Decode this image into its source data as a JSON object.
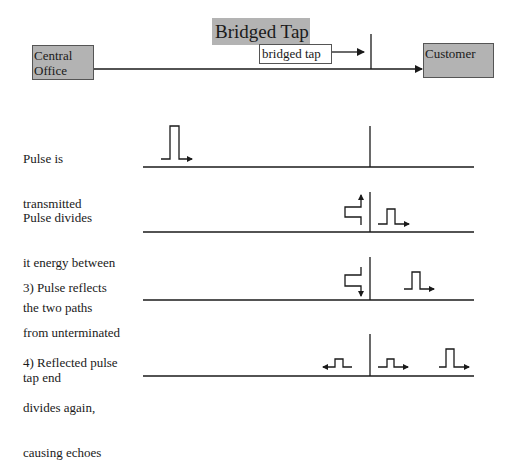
{
  "diagram": {
    "title": "Bridged Tap",
    "nodes": {
      "central_office": {
        "line1": "Central",
        "line2": "Office"
      },
      "customer": {
        "label": "Customer"
      },
      "tap_label": "bridged tap"
    },
    "colors": {
      "box_fill": "#b3b3b3",
      "line": "#1a1a1a",
      "background": "#ffffff"
    },
    "steps": [
      {
        "lines": [
          "Pulse is",
          "transmitted"
        ]
      },
      {
        "lines": [
          "Pulse divides",
          "it energy between",
          "the two paths"
        ]
      },
      {
        "lines": [
          "3) Pulse reflects",
          "from unterminated",
          "tap end"
        ]
      },
      {
        "lines": [
          "4) Reflected pulse",
          "divides again,",
          "causing echoes"
        ]
      }
    ]
  }
}
